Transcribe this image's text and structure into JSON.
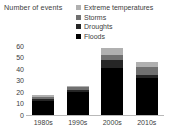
{
  "chart_data": {
    "type": "bar",
    "subtype": "stacked-bar",
    "title": "",
    "ylabel": "Number of events",
    "xlabel": "",
    "categories": [
      "1980s",
      "1990s",
      "2000s",
      "2010s"
    ],
    "ylim": [
      0,
      60
    ],
    "ytick_values": [
      60,
      50,
      40,
      30,
      20,
      10,
      0
    ],
    "ytick_labels": [
      "60",
      "50",
      "40",
      "30",
      "20",
      "10",
      "0"
    ],
    "grid": false,
    "legend_position": "top-right",
    "series": [
      {
        "name": "Floods",
        "color": "#000000",
        "values": [
          12,
          20,
          41,
          32
        ]
      },
      {
        "name": "Droughts",
        "color": "#262626",
        "values": [
          2,
          2,
          7,
          3
        ]
      },
      {
        "name": "Storms",
        "color": "#707070",
        "values": [
          2,
          2,
          4,
          7
        ]
      },
      {
        "name": "Extreme temperatures",
        "color": "#b0b0b0",
        "values": [
          1,
          1,
          6,
          4
        ]
      }
    ],
    "totals": [
      17,
      25,
      58,
      46
    ],
    "stack_order_bottom_to_top": [
      "Floods",
      "Droughts",
      "Storms",
      "Extreme temperatures"
    ]
  },
  "legend": {
    "items": [
      {
        "label": "Extreme temperatures",
        "color": "#b0b0b0"
      },
      {
        "label": "Storms",
        "color": "#707070"
      },
      {
        "label": "Droughts",
        "color": "#262626"
      },
      {
        "label": "Floods",
        "color": "#000000"
      }
    ]
  },
  "axis": {
    "y_title": "Number of events"
  }
}
